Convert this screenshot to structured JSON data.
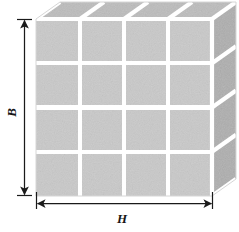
{
  "figure": {
    "kind": "engineering-diagram",
    "background_color": "#ffffff"
  },
  "labels": {
    "height_label": "B",
    "width_label": "H"
  },
  "dimensions": {
    "rows": 4,
    "columns": 4,
    "vertical_dimension": {
      "name": "B",
      "orientation": "vertical",
      "arrow_style": "double-ended"
    },
    "horizontal_dimension": {
      "name": "H",
      "orientation": "horizontal",
      "arrow_style": "double-ended"
    }
  },
  "colors": {
    "front_face": "#c9c9c9",
    "top_face": "#bdbdbd",
    "side_face": "#b0b0b0",
    "grout": "#ffffff",
    "edge_line": "#ffffff",
    "dimension_line": "#1a1a1a",
    "label_text": "#161616"
  },
  "geometry": {
    "front_left_x": 36,
    "front_right_x": 212,
    "front_top_y": 19,
    "front_bottom_y": 196,
    "depth_dx": 24,
    "depth_dy": -17,
    "cell_gap": 4
  }
}
